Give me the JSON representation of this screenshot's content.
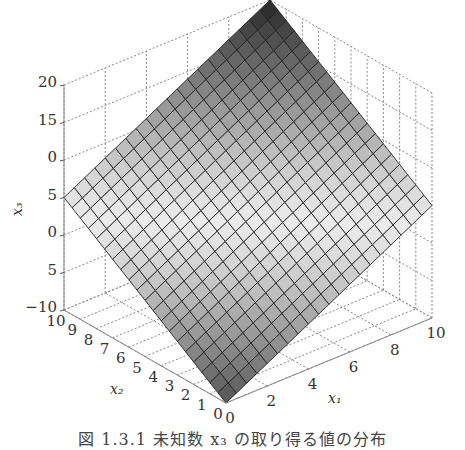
{
  "caption": "図 1.3.1  未知数 x₃ の取り得る値の分布",
  "chart_data": {
    "type": "surface3d",
    "title": "",
    "caption": "図 1.3.1 未知数 x₃ の取り得る値の分布",
    "xlabel": "x₁",
    "ylabel": "x₂",
    "zlabel": "x₃",
    "x_ticks": [
      "0",
      "2",
      "4",
      "6",
      "8",
      "10"
    ],
    "y_ticks": [
      "0",
      "1",
      "2",
      "3",
      "4",
      "5",
      "6",
      "7",
      "8",
      "9",
      "10"
    ],
    "z_ticks": [
      "20",
      "15",
      "0",
      "5",
      "0",
      "5",
      "−10"
    ],
    "x_range": [
      0,
      10
    ],
    "y_range": [
      0,
      10
    ],
    "z_range": [
      -10,
      20
    ],
    "grid": true,
    "colormap": "gray",
    "surface": "plane: x₃ rises from about −10 at (x₁=0,x₂=0) to about 20 at (x₁=10,x₂=10)",
    "mesh_cells": 20,
    "corners": [
      {
        "x1": 0,
        "x2": 0,
        "x3": -10
      },
      {
        "x1": 10,
        "x2": 0,
        "x3": 5
      },
      {
        "x1": 0,
        "x2": 10,
        "x3": 5
      },
      {
        "x1": 10,
        "x2": 10,
        "x3": 20
      }
    ]
  }
}
